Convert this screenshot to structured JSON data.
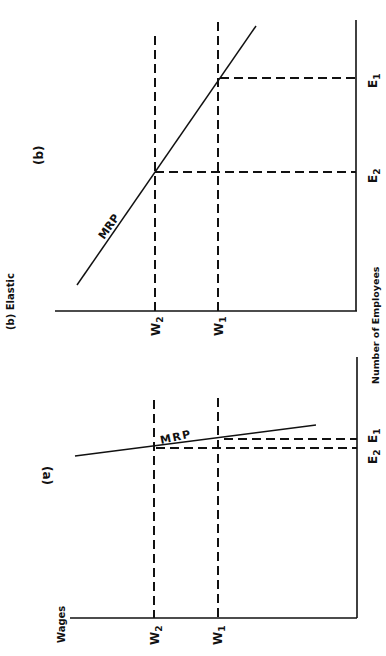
{
  "title": "(b) Elastic",
  "axis_labels": {
    "x": "Wages",
    "y": "Number of Employees"
  },
  "panels": [
    {
      "id": "b",
      "label": "(b)",
      "curve_label": "MRP",
      "elasticity": "elastic",
      "wage_levels": [
        {
          "name": "W",
          "sub": "2"
        },
        {
          "name": "W",
          "sub": "1"
        }
      ],
      "employment_levels": [
        {
          "name": "E",
          "sub": "2"
        },
        {
          "name": "E",
          "sub": "1"
        }
      ]
    },
    {
      "id": "a",
      "label": "(a)",
      "curve_label": "MRP",
      "elasticity": "inelastic",
      "wage_levels": [
        {
          "name": "W",
          "sub": "2"
        },
        {
          "name": "W",
          "sub": "1"
        }
      ],
      "employment_levels": [
        {
          "name": "E",
          "sub": "2"
        },
        {
          "name": "E",
          "sub": "1"
        }
      ]
    }
  ],
  "colors": {
    "ink": "#111111",
    "background": "#ffffff"
  }
}
